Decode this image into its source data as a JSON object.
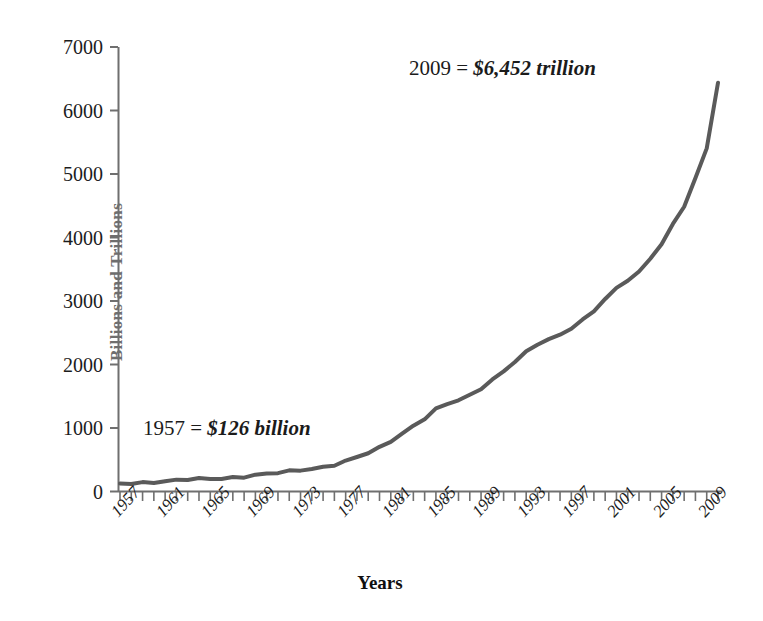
{
  "chart_data": {
    "type": "line",
    "title": "",
    "xlabel": "Years",
    "ylabel": "Billions and Trillions",
    "ylim": [
      0,
      7000
    ],
    "xlim": [
      1957,
      2010
    ],
    "grid": false,
    "legend": null,
    "y_ticks": [
      0,
      1000,
      2000,
      3000,
      4000,
      5000,
      6000,
      7000
    ],
    "y_tick_labels": [
      "0",
      "1000",
      "2000",
      "3000",
      "4000",
      "5000",
      "6000",
      "7000"
    ],
    "x_tick_labels": [
      "1957",
      "1961",
      "1965",
      "1969",
      "1973",
      "1977",
      "1981",
      "1985",
      "1989",
      "1993",
      "1997",
      "2001",
      "2005",
      "2009"
    ],
    "x_tick_label_years": [
      1957,
      1961,
      1965,
      1969,
      1973,
      1977,
      1981,
      1985,
      1989,
      1993,
      1997,
      2001,
      2005,
      2009
    ],
    "x_minor_tick_step_years": 1,
    "series": [
      {
        "name": "Total debt",
        "color": "#5a5a5a",
        "line_width": 4,
        "x": [
          1957,
          1958,
          1959,
          1960,
          1961,
          1962,
          1963,
          1964,
          1965,
          1966,
          1967,
          1968,
          1969,
          1970,
          1971,
          1972,
          1973,
          1974,
          1975,
          1976,
          1977,
          1978,
          1979,
          1980,
          1981,
          1982,
          1983,
          1984,
          1985,
          1986,
          1987,
          1988,
          1989,
          1990,
          1991,
          1992,
          1993,
          1994,
          1995,
          1996,
          1997,
          1998,
          1999,
          2000,
          2001,
          2002,
          2003,
          2004,
          2005,
          2006,
          2007,
          2008,
          2009,
          2010
        ],
        "values": [
          126,
          135,
          145,
          152,
          160,
          172,
          183,
          191,
          200,
          210,
          225,
          240,
          260,
          275,
          290,
          310,
          335,
          360,
          390,
          430,
          480,
          540,
          600,
          680,
          790,
          910,
          1040,
          1160,
          1300,
          1380,
          1430,
          1500,
          1620,
          1760,
          1900,
          2060,
          2200,
          2320,
          2390,
          2450,
          2570,
          2700,
          2850,
          3050,
          3200,
          3330,
          3450,
          3650,
          3900,
          4200,
          4500,
          4950,
          5400,
          6452
        ]
      }
    ],
    "annotations": [
      {
        "id": "start",
        "prefix": "1957 = ",
        "value": "$126 billion",
        "at_year": 1957,
        "at_value": 126
      },
      {
        "id": "end",
        "prefix": "2009 = ",
        "value": "$6,452 trillion",
        "at_year": 2009,
        "at_value": 6452
      }
    ]
  },
  "axes": {
    "y_label": "Billions and Trillions",
    "x_label": "Years"
  }
}
